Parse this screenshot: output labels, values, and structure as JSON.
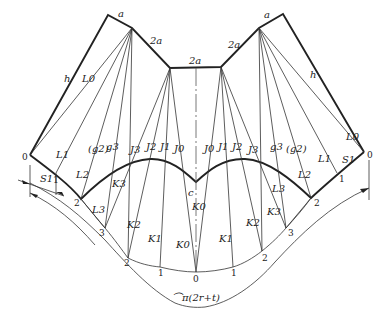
{
  "diagram": {
    "type": "sheet-metal development (unfolded transition piece pattern)",
    "edge_labels": {
      "top_left_a": "a",
      "top_left_2a": "2a",
      "top_center_2a": "2a",
      "top_right_2a": "2a",
      "top_right_a": "a",
      "left_h": "h",
      "right_h": "h"
    },
    "left_fan_labels": [
      "L0",
      "L1",
      "(g2)",
      "g3",
      "L2",
      "K3",
      "L3",
      "J3",
      "J2",
      "J1",
      "J0"
    ],
    "right_fan_labels": [
      "J0",
      "J1",
      "J2",
      "J3",
      "g3",
      "(g2)",
      "L2",
      "L3",
      "K3",
      "L1",
      "L0",
      "S1"
    ],
    "bottom_labels": [
      "K2",
      "K1",
      "K0",
      "c",
      "K0",
      "K1",
      "K2"
    ],
    "point_numbers_left": [
      "0",
      "1",
      "2",
      "3",
      "2",
      "1"
    ],
    "point_numbers_bottom": [
      "0"
    ],
    "point_numbers_right": [
      "1",
      "2",
      "3",
      "2",
      "1",
      "0"
    ],
    "dimension_label": "S1",
    "arc_length_label": "⌒π(2r+t)"
  }
}
